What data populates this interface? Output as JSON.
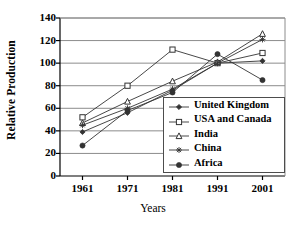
{
  "chart_data": {
    "type": "line",
    "title": "",
    "xlabel": "Years",
    "ylabel": "Relative Production",
    "categories": [
      "1961",
      "1971",
      "1981",
      "1991",
      "2001"
    ],
    "x": [
      1961,
      1971,
      1981,
      1991,
      2001
    ],
    "ylim": [
      0,
      140
    ],
    "xlim": [
      1956,
      2006
    ],
    "yticks": [
      "0",
      "20",
      "40",
      "60",
      "80",
      "100",
      "120",
      "140"
    ],
    "ytick_values": [
      0,
      20,
      40,
      60,
      80,
      100,
      120,
      140
    ],
    "grid": "horizontal",
    "legend_position": "inside-lower-right",
    "series": [
      {
        "name": "United Kingdom",
        "marker": "filled-diamond",
        "color": "#333333",
        "values": [
          39,
          56,
          76,
          100,
          102
        ]
      },
      {
        "name": "USA and Canada",
        "marker": "open-square",
        "color": "#333333",
        "values": [
          52,
          80,
          112,
          100,
          109
        ]
      },
      {
        "name": "India",
        "marker": "open-triangle",
        "color": "#333333",
        "values": [
          47,
          66,
          84,
          101,
          126
        ]
      },
      {
        "name": "China",
        "marker": "asterisk",
        "color": "#333333",
        "values": [
          45,
          60,
          77,
          100,
          121
        ]
      },
      {
        "name": "Africa",
        "marker": "filled-circle",
        "color": "#333333",
        "values": [
          27,
          58,
          74,
          108,
          85
        ]
      }
    ]
  },
  "legend": {
    "entries": [
      {
        "label": "United Kingdom"
      },
      {
        "label": "USA and Canada"
      },
      {
        "label": "India"
      },
      {
        "label": "China"
      },
      {
        "label": "Africa"
      }
    ]
  },
  "axes": {
    "y_title": "Relative Production",
    "x_title": "Years"
  },
  "colors": {
    "axis": "#000000",
    "grid": "#8c8c8c",
    "series": "#333333",
    "background": "#ffffff"
  }
}
